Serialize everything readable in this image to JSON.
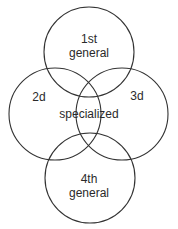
{
  "diagram": {
    "circles": [
      {
        "id": "first",
        "cx": 89,
        "cy": 52,
        "r": 45,
        "label_lines": [
          "1st",
          "general"
        ]
      },
      {
        "id": "second",
        "cx": 55,
        "cy": 114,
        "r": 46,
        "label_lines": [
          "2d"
        ]
      },
      {
        "id": "third",
        "cx": 122,
        "cy": 114,
        "r": 46,
        "label_lines": [
          "3d"
        ]
      },
      {
        "id": "fourth",
        "cx": 90,
        "cy": 178,
        "r": 45,
        "label_lines": [
          "4th",
          "general"
        ]
      }
    ],
    "center_label": "specialized",
    "stroke_color": "#333333"
  }
}
